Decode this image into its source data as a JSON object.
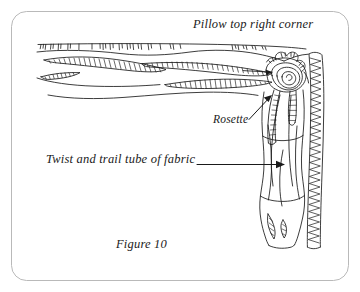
{
  "figure": {
    "frame": {
      "border_color": "#b9b9b9",
      "background_color": "#ffffff",
      "corner_radius": 14
    },
    "ink_color": "#1a1a1a",
    "title": "Pillow top right corner",
    "caption": "Figure 10",
    "annotations": [
      {
        "id": "rosette",
        "label": "Rosette",
        "arrow": "points up-right toward the spiral rosette"
      },
      {
        "id": "tube",
        "label": "Twist and trail tube of fabric",
        "arrow": "points right toward the vertical fabric tube"
      }
    ],
    "illustration": {
      "type": "line-drawing",
      "subject": "pillow corner with gathered trim, spiral rosette and trailing twisted tube of fabric",
      "elements": [
        "top-edge fringe / stitched seam",
        "hatched gathered fabric swags",
        "spiral rosette at corner",
        "trailing ribbon tails",
        "vertical twisted tube of fabric",
        "zigzag ruffled right edge"
      ]
    }
  }
}
